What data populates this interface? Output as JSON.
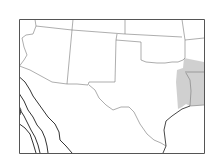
{
  "map": {
    "title": "",
    "region": "South-central United States",
    "colors": {
      "background": "#ffffff",
      "frame": "#555555",
      "borders": "#777777",
      "shading": "#c8c8c8",
      "contours": "#333333"
    },
    "shaded_region": "East Texas / western Louisiana / southeastern Oklahoma / southwestern Arkansas",
    "contour_count": 4,
    "paths": {
      "frame": "M19.5 19.5 H204.5 V153.5 H19.5 Z",
      "shade": "M184 58 L204 62 L204 105 L190 106 L186 104 L182 107 L178 109 L177 95 L176 82 L177 70 L183 68 Z",
      "borders": [
        "M35 19.5 L36 26",
        "M73 19.5 L72 30",
        "M36 26 L72 30 L125 34 L182 37",
        "M125 19.5 L125 34",
        "M182 19.5 L185 40 L185 58",
        "M185 40 L204 38",
        "M72 30 L67 84",
        "M117 34 L116 40 L141 42 L141 60",
        "M116 40 L115 82 L89 82 L88 85 L77 84 L67 84",
        "M185 72 L204 72",
        "M186 73 L190 80 L191 91 L190 106 L204 105",
        "M19.5 66 L30 70 L52 82 L67 84"
      ],
      "state_river": "M141 60 L146 62 L157 63 L165 63 L172 62 L178 62 L183 60 L185 58",
      "rio_grande": "M89 85 L95 90 L99 98 L106 105 L113 110 L121 107 L129 107 L134 112 L140 124 L147 134 L154 140 L161 143 L166 146",
      "coast": "M190 106 L182 109 L172 116 L166 121 L164 130 L165 138 L166 146 L163 153",
      "az_west": "M36 26 L33 34 L26 35 L22 38 L24 47 L27 55 L24 60 L21 64 L19.5 66",
      "contours": [
        "M19.5 77 L25 82 L30 90 L33 96 L38 103 L43 110 L48 117 L55 124 L59 132 L60 140 L66 146 L72 153",
        "M19.5 94 L24 101 L28 110 L33 117 L37 125 L42 131 L45 138 L47 146 L48 153",
        "M19.5 109 L24 116 L28 124 L31 130 L35 137 L38 145 L40 153",
        "M19.5 124 L25 128 L30 134 L33 143 L36 153"
      ],
      "coast_left": "M19.5 107 L21 110 L20 115"
    }
  }
}
